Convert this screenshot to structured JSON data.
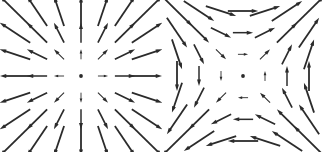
{
  "figure": {
    "width": 324,
    "height": 152,
    "background_color": "#ffffff",
    "arrow_color": "#2b2b2b",
    "panel_count": 2
  },
  "chart_data": [
    {
      "type": "quiver",
      "name": "radial-source-field",
      "title": "",
      "xlabel": "",
      "ylabel": "",
      "grid": false,
      "axes_visible": false,
      "legend": "none",
      "xlim": [
        -3,
        3
      ],
      "ylim": [
        -3,
        3
      ],
      "grid_x": [
        -3,
        -2,
        -1,
        0,
        1,
        2,
        3
      ],
      "grid_y": [
        -3,
        -2,
        -1,
        0,
        1,
        2,
        3
      ],
      "formula": "F(x, y) = (x, y)",
      "description": "Radially outward source field; arrow length grows with distance from origin; zero vector drawn as a dot at the origin",
      "arrow_color": "#2b2b2b",
      "scale": 0.46,
      "vectors": [
        {
          "x": -3,
          "y": 3,
          "u": -3,
          "v": 3
        },
        {
          "x": -2,
          "y": 3,
          "u": -2,
          "v": 3
        },
        {
          "x": -1,
          "y": 3,
          "u": -1,
          "v": 3
        },
        {
          "x": 0,
          "y": 3,
          "u": 0,
          "v": 3
        },
        {
          "x": 1,
          "y": 3,
          "u": 1,
          "v": 3
        },
        {
          "x": 2,
          "y": 3,
          "u": 2,
          "v": 3
        },
        {
          "x": 3,
          "y": 3,
          "u": 3,
          "v": 3
        },
        {
          "x": -3,
          "y": 2,
          "u": -3,
          "v": 2
        },
        {
          "x": -2,
          "y": 2,
          "u": -2,
          "v": 2
        },
        {
          "x": -1,
          "y": 2,
          "u": -1,
          "v": 2
        },
        {
          "x": 0,
          "y": 2,
          "u": 0,
          "v": 2
        },
        {
          "x": 1,
          "y": 2,
          "u": 1,
          "v": 2
        },
        {
          "x": 2,
          "y": 2,
          "u": 2,
          "v": 2
        },
        {
          "x": 3,
          "y": 2,
          "u": 3,
          "v": 2
        },
        {
          "x": -3,
          "y": 1,
          "u": -3,
          "v": 1
        },
        {
          "x": -2,
          "y": 1,
          "u": -2,
          "v": 1
        },
        {
          "x": -1,
          "y": 1,
          "u": -1,
          "v": 1
        },
        {
          "x": 0,
          "y": 1,
          "u": 0,
          "v": 1
        },
        {
          "x": 1,
          "y": 1,
          "u": 1,
          "v": 1
        },
        {
          "x": 2,
          "y": 1,
          "u": 2,
          "v": 1
        },
        {
          "x": 3,
          "y": 1,
          "u": 3,
          "v": 1
        },
        {
          "x": -3,
          "y": 0,
          "u": -3,
          "v": 0
        },
        {
          "x": -2,
          "y": 0,
          "u": -2,
          "v": 0
        },
        {
          "x": -1,
          "y": 0,
          "u": -1,
          "v": 0
        },
        {
          "x": 0,
          "y": 0,
          "u": 0,
          "v": 0
        },
        {
          "x": 1,
          "y": 0,
          "u": 1,
          "v": 0
        },
        {
          "x": 2,
          "y": 0,
          "u": 2,
          "v": 0
        },
        {
          "x": 3,
          "y": 0,
          "u": 3,
          "v": 0
        },
        {
          "x": -3,
          "y": -1,
          "u": -3,
          "v": -1
        },
        {
          "x": -2,
          "y": -1,
          "u": -2,
          "v": -1
        },
        {
          "x": -1,
          "y": -1,
          "u": -1,
          "v": -1
        },
        {
          "x": 0,
          "y": -1,
          "u": 0,
          "v": -1
        },
        {
          "x": 1,
          "y": -1,
          "u": 1,
          "v": -1
        },
        {
          "x": 2,
          "y": -1,
          "u": 2,
          "v": -1
        },
        {
          "x": 3,
          "y": -1,
          "u": 3,
          "v": -1
        },
        {
          "x": -3,
          "y": -2,
          "u": -3,
          "v": -2
        },
        {
          "x": -2,
          "y": -2,
          "u": -2,
          "v": -2
        },
        {
          "x": -1,
          "y": -2,
          "u": -1,
          "v": -2
        },
        {
          "x": 0,
          "y": -2,
          "u": 0,
          "v": -2
        },
        {
          "x": 1,
          "y": -2,
          "u": 1,
          "v": -2
        },
        {
          "x": 2,
          "y": -2,
          "u": 2,
          "v": -2
        },
        {
          "x": 3,
          "y": -2,
          "u": 3,
          "v": -2
        },
        {
          "x": -3,
          "y": -3,
          "u": -3,
          "v": -3
        },
        {
          "x": -2,
          "y": -3,
          "u": -2,
          "v": -3
        },
        {
          "x": -1,
          "y": -3,
          "u": -1,
          "v": -3
        },
        {
          "x": 0,
          "y": -3,
          "u": 0,
          "v": -3
        },
        {
          "x": 1,
          "y": -3,
          "u": 1,
          "v": -3
        },
        {
          "x": 2,
          "y": -3,
          "u": 2,
          "v": -3
        },
        {
          "x": 3,
          "y": -3,
          "u": 3,
          "v": -3
        }
      ]
    },
    {
      "type": "quiver",
      "name": "saddle-hyperbolic-field",
      "title": "",
      "xlabel": "",
      "ylabel": "",
      "grid": false,
      "axes_visible": false,
      "legend": "none",
      "xlim": [
        -3,
        3
      ],
      "ylim": [
        -3,
        3
      ],
      "grid_x": [
        -3,
        -2,
        -1,
        0,
        1,
        2,
        3
      ],
      "grid_y": [
        -3,
        -2,
        -1,
        0,
        1,
        2,
        3
      ],
      "formula": "F(x, y) = (y, x)",
      "description": "Hyperbolic saddle field; top row points right, bottom row points left, left column points down, right column points up; zero vector drawn as a dot at the origin",
      "arrow_color": "#2b2b2b",
      "scale": 0.46,
      "vectors": [
        {
          "x": -3,
          "y": 3,
          "u": 3,
          "v": -3
        },
        {
          "x": -2,
          "y": 3,
          "u": 3,
          "v": -2
        },
        {
          "x": -1,
          "y": 3,
          "u": 3,
          "v": -1
        },
        {
          "x": 0,
          "y": 3,
          "u": 3,
          "v": 0
        },
        {
          "x": 1,
          "y": 3,
          "u": 3,
          "v": 1
        },
        {
          "x": 2,
          "y": 3,
          "u": 3,
          "v": 2
        },
        {
          "x": 3,
          "y": 3,
          "u": 3,
          "v": 3
        },
        {
          "x": -3,
          "y": 2,
          "u": 2,
          "v": -3
        },
        {
          "x": -2,
          "y": 2,
          "u": 2,
          "v": -2
        },
        {
          "x": -1,
          "y": 2,
          "u": 2,
          "v": -1
        },
        {
          "x": 0,
          "y": 2,
          "u": 2,
          "v": 0
        },
        {
          "x": 1,
          "y": 2,
          "u": 2,
          "v": 1
        },
        {
          "x": 2,
          "y": 2,
          "u": 2,
          "v": 2
        },
        {
          "x": 3,
          "y": 2,
          "u": 2,
          "v": 3
        },
        {
          "x": -3,
          "y": 1,
          "u": 1,
          "v": -3
        },
        {
          "x": -2,
          "y": 1,
          "u": 1,
          "v": -2
        },
        {
          "x": -1,
          "y": 1,
          "u": 1,
          "v": -1
        },
        {
          "x": 0,
          "y": 1,
          "u": 1,
          "v": 0
        },
        {
          "x": 1,
          "y": 1,
          "u": 1,
          "v": 1
        },
        {
          "x": 2,
          "y": 1,
          "u": 1,
          "v": 2
        },
        {
          "x": 3,
          "y": 1,
          "u": 1,
          "v": 3
        },
        {
          "x": -3,
          "y": 0,
          "u": 0,
          "v": -3
        },
        {
          "x": -2,
          "y": 0,
          "u": 0,
          "v": -2
        },
        {
          "x": -1,
          "y": 0,
          "u": 0,
          "v": -1
        },
        {
          "x": 0,
          "y": 0,
          "u": 0,
          "v": 0
        },
        {
          "x": 1,
          "y": 0,
          "u": 0,
          "v": 1
        },
        {
          "x": 2,
          "y": 0,
          "u": 0,
          "v": 2
        },
        {
          "x": 3,
          "y": 0,
          "u": 0,
          "v": 3
        },
        {
          "x": -3,
          "y": -1,
          "u": -1,
          "v": -3
        },
        {
          "x": -2,
          "y": -1,
          "u": -1,
          "v": -2
        },
        {
          "x": -1,
          "y": -1,
          "u": -1,
          "v": -1
        },
        {
          "x": 0,
          "y": -1,
          "u": -1,
          "v": 0
        },
        {
          "x": 1,
          "y": -1,
          "u": -1,
          "v": 1
        },
        {
          "x": 2,
          "y": -1,
          "u": -1,
          "v": 2
        },
        {
          "x": 3,
          "y": -1,
          "u": -1,
          "v": 3
        },
        {
          "x": -3,
          "y": -2,
          "u": -2,
          "v": -3
        },
        {
          "x": -2,
          "y": -2,
          "u": -2,
          "v": -2
        },
        {
          "x": -1,
          "y": -2,
          "u": -2,
          "v": -1
        },
        {
          "x": 0,
          "y": -2,
          "u": -2,
          "v": 0
        },
        {
          "x": 1,
          "y": -2,
          "u": -2,
          "v": 1
        },
        {
          "x": 2,
          "y": -2,
          "u": -2,
          "v": 2
        },
        {
          "x": 3,
          "y": -2,
          "u": -2,
          "v": 3
        },
        {
          "x": -3,
          "y": -3,
          "u": -3,
          "v": -3
        },
        {
          "x": -2,
          "y": -3,
          "u": -3,
          "v": -2
        },
        {
          "x": -1,
          "y": -3,
          "u": -3,
          "v": -1
        },
        {
          "x": 0,
          "y": -3,
          "u": -3,
          "v": 0
        },
        {
          "x": 1,
          "y": -3,
          "u": -3,
          "v": 1
        },
        {
          "x": 2,
          "y": -3,
          "u": -3,
          "v": 2
        },
        {
          "x": 3,
          "y": -3,
          "u": -3,
          "v": 3
        }
      ]
    }
  ]
}
